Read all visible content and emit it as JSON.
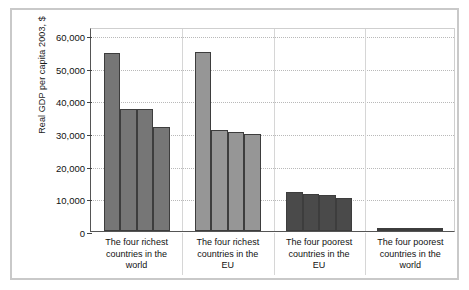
{
  "figure": {
    "background_color": "#ffffff",
    "frame_color": "#c9c9c9"
  },
  "chart_data": {
    "type": "bar",
    "title": "",
    "xlabel": "",
    "ylabel": "Real GDP per capita 2003, $",
    "ylim": [
      0,
      60000
    ],
    "ytick_labels": [
      "0",
      "10,000",
      "20,000",
      "30,000",
      "40,000",
      "50,000",
      "60,000"
    ],
    "ytick_values": [
      0,
      10000,
      20000,
      30000,
      40000,
      50000,
      60000
    ],
    "grid": true,
    "grid_axis": "y",
    "legend": "none",
    "categories": [
      "The four richest countries in the world",
      "The four richest countries in the EU",
      "The four poorest countries in the EU",
      "The four poorest countries in the world"
    ],
    "category_lines": [
      [
        "The four richest",
        "countries in the",
        "world"
      ],
      [
        "The four richest",
        "countries in the",
        "EU"
      ],
      [
        "The four poorest",
        "countries in the",
        "EU"
      ],
      [
        "The four poorest",
        "countries in the",
        "world"
      ]
    ],
    "groups": [
      {
        "name": "The four richest countries in the world",
        "color": "#767676",
        "values": [
          54500,
          37500,
          37200,
          31800
        ]
      },
      {
        "name": "The four richest countries in the EU",
        "color": "#969696",
        "values": [
          54700,
          31000,
          30200,
          29600
        ]
      },
      {
        "name": "The four poorest countries in the EU",
        "color": "#4a4a4a",
        "values": [
          11900,
          11200,
          10900,
          10100
        ]
      },
      {
        "name": "The four poorest countries in the world",
        "color": "#3c3c3c",
        "values": [
          900,
          800,
          800,
          700
        ]
      }
    ]
  }
}
